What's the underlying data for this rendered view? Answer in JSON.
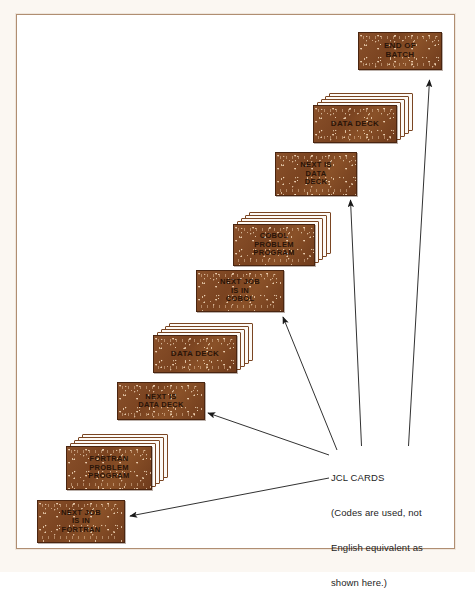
{
  "figure": {
    "background_color": "#ffffff",
    "frame_color": "#b08e72",
    "card_color": "#7c4522",
    "card_text_color": "#2a1408",
    "arrow_color": "#1a1a1a"
  },
  "cards": [
    {
      "id": "end-of-batch",
      "kind": "single",
      "lines": [
        "END OF",
        "BATCH"
      ]
    },
    {
      "id": "data-deck-upper",
      "kind": "deck",
      "lines": [
        "DATA DECK"
      ]
    },
    {
      "id": "next-is-data-deck-upper",
      "kind": "single",
      "lines": [
        "NEXT IS",
        "DATA",
        "DECK"
      ]
    },
    {
      "id": "cobol-problem-program",
      "kind": "deck",
      "lines": [
        "COBOL",
        "PROBLEM",
        "PROGRAM"
      ]
    },
    {
      "id": "next-job-is-in-cobol",
      "kind": "single",
      "lines": [
        "NEXT JOB",
        "IS IN",
        "COBOL"
      ]
    },
    {
      "id": "data-deck-lower",
      "kind": "deck",
      "lines": [
        "DATA DECK"
      ]
    },
    {
      "id": "next-is-data-deck-lower",
      "kind": "single",
      "lines": [
        "NEXT IS",
        "DATA DECK"
      ]
    },
    {
      "id": "fortran-problem-program",
      "kind": "deck",
      "lines": [
        "FORTRAN",
        "PROBLEM",
        "PROGRAM"
      ]
    },
    {
      "id": "next-job-is-in-fortran",
      "kind": "single",
      "lines": [
        "NEXT JOB",
        "IS IN",
        "FORTRAN"
      ]
    }
  ],
  "annotation": {
    "heading": "JCL CARDS",
    "note_line_1": "(Codes are used, not",
    "note_line_2": "English equivalent as",
    "note_line_3": "shown here.)"
  }
}
